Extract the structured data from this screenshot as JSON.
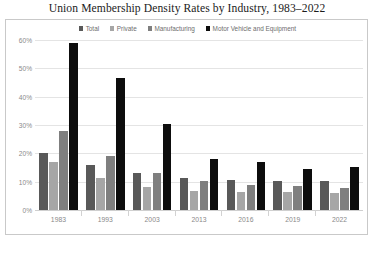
{
  "chart_data": {
    "type": "bar",
    "title": "Union Membership Density Rates by Industry, 1983–2022",
    "xlabel": "",
    "ylabel": "",
    "ylim": [
      0,
      60
    ],
    "ytick_labels": [
      "0%",
      "10%",
      "20%",
      "30%",
      "40%",
      "50%",
      "60%"
    ],
    "ytick_values": [
      0,
      10,
      20,
      30,
      40,
      50,
      60
    ],
    "grid": true,
    "legend_position": "top-center",
    "categories": [
      "1983",
      "1993",
      "2003",
      "2013",
      "2016",
      "2019",
      "2022"
    ],
    "series": [
      {
        "name": "Total",
        "color": "#595959",
        "values": [
          20.1,
          15.8,
          12.9,
          11.3,
          10.7,
          10.3,
          10.1
        ]
      },
      {
        "name": "Private",
        "color": "#a6a6a6",
        "values": [
          16.8,
          11.2,
          8.2,
          6.7,
          6.4,
          6.2,
          6.0
        ]
      },
      {
        "name": "Manufacturing",
        "color": "#7f7f7f",
        "values": [
          27.8,
          19.2,
          13.2,
          10.2,
          9.0,
          8.6,
          7.8
        ]
      },
      {
        "name": "Motor Vehicle and Equipment",
        "color": "#0d0d0d",
        "values": [
          59.0,
          46.6,
          30.2,
          18.0,
          17.0,
          14.3,
          15.1
        ]
      }
    ]
  },
  "colors": {
    "total": "#595959",
    "private": "#a6a6a6",
    "manufacturing": "#7f7f7f",
    "motor_vehicle": "#0d0d0d",
    "gridline": "#e4e4e4",
    "border": "#c9c9c9",
    "tick_text": "#8a8a8a",
    "title_text": "#1b1b1b",
    "legend_text": "#6d6d6d"
  }
}
